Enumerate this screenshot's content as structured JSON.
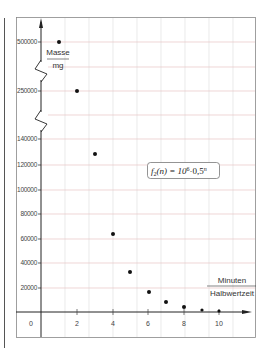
{
  "chart_data": {
    "type": "scatter",
    "title": "",
    "function_label": "f2(n) = 10^6 · 0,5^n",
    "function_parts": {
      "f": "f",
      "sub": "2",
      "arg": "(n) = 10",
      "exp1": "6",
      "mid": "·0,5",
      "exp2": "n"
    },
    "xlabel_top": "Minuten",
    "xlabel_bottom": "Halbwertzeit",
    "ylabel_top": "Masse",
    "ylabel_bottom": "mg",
    "x": [
      1,
      2,
      3,
      4,
      5,
      6,
      7,
      8,
      9,
      10
    ],
    "y": [
      500000,
      250000,
      125000,
      62500,
      31250,
      15625,
      7812.5,
      3906.25,
      1953.125,
      976.5625
    ],
    "x_tick_labels": [
      "0",
      "2",
      "4",
      "6",
      "8",
      "10"
    ],
    "y_tick_labels": [
      "500000",
      "250000",
      "140000",
      "120000",
      "100000",
      "80000",
      "60000",
      "40000",
      "20000"
    ],
    "y_axis_breaks": [
      [
        140000,
        250000
      ],
      [
        250000,
        500000
      ]
    ],
    "grid": true,
    "grid_color": "#e8c4c4",
    "xlim": [
      0,
      11
    ],
    "ylim": [
      0,
      520000
    ]
  },
  "ticks": {
    "y": [
      {
        "label": "500000",
        "py": 42
      },
      {
        "label": "250000",
        "py": 91
      },
      {
        "label": "140000",
        "py": 139
      },
      {
        "label": "120000",
        "py": 165
      },
      {
        "label": "100000",
        "py": 190
      },
      {
        "label": "80000",
        "py": 214
      },
      {
        "label": "60000",
        "py": 239
      },
      {
        "label": "40000",
        "py": 263
      },
      {
        "label": "20000",
        "py": 288
      }
    ],
    "x": [
      {
        "label": "0",
        "px": 31
      },
      {
        "label": "2",
        "px": 77
      },
      {
        "label": "4",
        "px": 113
      },
      {
        "label": "6",
        "px": 148
      },
      {
        "label": "8",
        "px": 184
      },
      {
        "label": "10",
        "px": 219
      }
    ]
  },
  "points_px": [
    [
      59,
      42
    ],
    [
      77,
      91
    ],
    [
      95,
      154
    ],
    [
      113,
      234
    ],
    [
      130,
      272
    ],
    [
      149,
      292
    ],
    [
      166,
      302
    ],
    [
      184,
      307
    ],
    [
      202,
      310
    ],
    [
      219,
      311
    ]
  ]
}
